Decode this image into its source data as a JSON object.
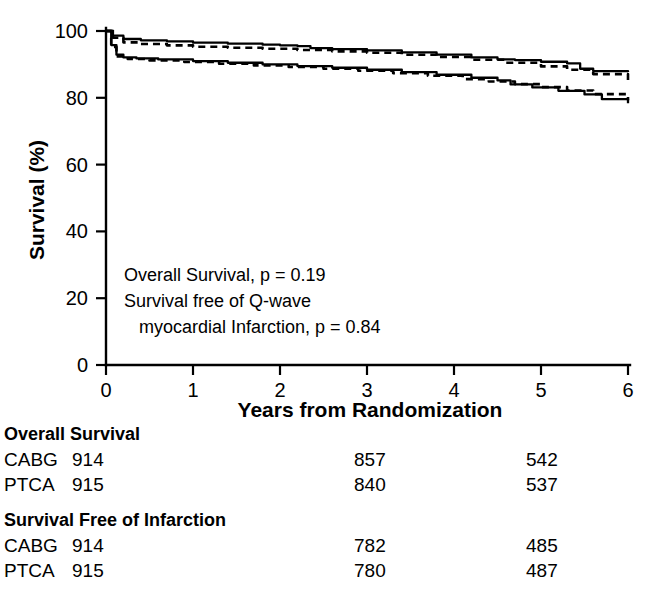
{
  "chart_data": {
    "type": "line",
    "title": "",
    "xlabel": "Years from Randomization",
    "ylabel": "Survival (%)",
    "xlim": [
      0,
      6
    ],
    "ylim": [
      0,
      100
    ],
    "xticks": [
      "0",
      "1",
      "2",
      "3",
      "4",
      "5",
      "6"
    ],
    "yticks": [
      "0",
      "20",
      "40",
      "60",
      "80",
      "100"
    ],
    "grid": false,
    "legend": "none",
    "annotations": [
      "Overall  Survival, p = 0.19",
      "Survival free of Q-wave",
      "myocardial Infarction, p = 0.84"
    ],
    "series": [
      {
        "name": "Overall Survival CABG",
        "style": "solid",
        "x": [
          0,
          0.08,
          0.2,
          0.4,
          0.7,
          1.0,
          1.4,
          1.8,
          2.0,
          2.2,
          2.35,
          2.6,
          3.0,
          3.4,
          3.8,
          4.2,
          4.5,
          4.7,
          5.0,
          5.3,
          5.45,
          5.6,
          6.0
        ],
        "y": [
          100,
          98.6,
          97.6,
          97.2,
          96.9,
          96.5,
          96.2,
          95.9,
          95.7,
          95.5,
          94.9,
          94.6,
          94.2,
          93.6,
          92.9,
          92.1,
          91.5,
          91.3,
          90.8,
          90.3,
          88.7,
          88.0,
          87.7
        ]
      },
      {
        "name": "Overall Survival PTCA",
        "style": "dashed",
        "x": [
          0,
          0.08,
          0.2,
          0.4,
          0.7,
          1.0,
          1.4,
          1.8,
          2.2,
          2.6,
          3.0,
          3.4,
          3.8,
          4.2,
          4.6,
          5.0,
          5.3,
          5.6,
          6.0
        ],
        "y": [
          100,
          98.0,
          96.6,
          96.1,
          95.7,
          95.3,
          95.0,
          94.7,
          94.3,
          93.9,
          93.5,
          92.9,
          92.2,
          91.4,
          90.5,
          89.4,
          88.4,
          87.1,
          85.3
        ]
      },
      {
        "name": "Survival Free of Infarction CABG",
        "style": "solid",
        "x": [
          0,
          0.06,
          0.12,
          0.2,
          0.35,
          0.6,
          1.0,
          1.4,
          1.8,
          2.2,
          2.6,
          3.0,
          3.4,
          3.8,
          4.2,
          4.5,
          4.65,
          4.9,
          5.2,
          5.5,
          5.7,
          6.0
        ],
        "y": [
          100,
          95.8,
          92.9,
          92.1,
          91.8,
          91.5,
          91.0,
          90.5,
          90.0,
          89.5,
          89.0,
          88.4,
          87.7,
          86.9,
          86.0,
          85.2,
          84.0,
          83.1,
          82.1,
          81.0,
          79.6,
          78.4
        ]
      },
      {
        "name": "Survival Free of Infarction PTCA",
        "style": "dashed",
        "x": [
          0,
          0.06,
          0.12,
          0.25,
          0.5,
          0.9,
          1.3,
          1.7,
          2.1,
          2.5,
          2.9,
          3.3,
          3.7,
          4.1,
          4.4,
          4.7,
          5.0,
          5.3,
          5.6,
          6.0
        ],
        "y": [
          100,
          95.2,
          92.4,
          91.6,
          91.2,
          90.7,
          90.2,
          89.7,
          89.2,
          88.7,
          88.1,
          87.4,
          86.6,
          85.6,
          84.9,
          84.1,
          83.2,
          82.2,
          81.1,
          79.3
        ]
      }
    ]
  },
  "risk_table": {
    "sections": [
      {
        "title": "Overall Survival",
        "rows": [
          {
            "label": "CABG",
            "values": [
              "914",
              "857",
              "542"
            ]
          },
          {
            "label": "PTCA",
            "values": [
              "915",
              "840",
              "537"
            ]
          }
        ]
      },
      {
        "title": "Survival Free of Infarction",
        "rows": [
          {
            "label": "CABG",
            "values": [
              "914",
              "782",
              "485"
            ]
          },
          {
            "label": "PTCA",
            "values": [
              "915",
              "780",
              "487"
            ]
          }
        ]
      }
    ]
  },
  "colors": {
    "ink": "#000000",
    "paper": "#ffffff"
  }
}
